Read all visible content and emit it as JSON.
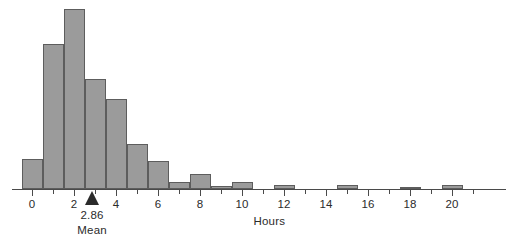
{
  "chart_data": {
    "type": "bar",
    "title": "",
    "xlabel": "Hours",
    "ylabel": "",
    "grid": false,
    "legend": null,
    "bin_width": 1,
    "x_axis": {
      "min": -0.5,
      "max": 22.3,
      "major_tick_labels": [
        "0",
        "2",
        "4",
        "6",
        "8",
        "10",
        "12",
        "14",
        "16",
        "18",
        "20"
      ],
      "major_tick_values": [
        0,
        2,
        4,
        6,
        8,
        10,
        12,
        14,
        16,
        18,
        20
      ],
      "minor_tick_values": [
        1,
        3,
        5,
        7,
        9,
        11,
        13,
        15,
        17,
        19,
        21
      ]
    },
    "bins": [
      {
        "left": -0.5,
        "right": 0.5,
        "center": 0,
        "height": 30
      },
      {
        "left": 0.5,
        "right": 1.5,
        "center": 1,
        "height": 145
      },
      {
        "left": 1.5,
        "right": 2.5,
        "center": 2,
        "height": 180
      },
      {
        "left": 2.5,
        "right": 3.5,
        "center": 3,
        "height": 110
      },
      {
        "left": 3.5,
        "right": 4.5,
        "center": 4,
        "height": 90
      },
      {
        "left": 4.5,
        "right": 5.5,
        "center": 5,
        "height": 45
      },
      {
        "left": 5.5,
        "right": 6.5,
        "center": 6,
        "height": 28
      },
      {
        "left": 6.5,
        "right": 7.5,
        "center": 7,
        "height": 7
      },
      {
        "left": 7.5,
        "right": 8.5,
        "center": 8,
        "height": 15
      },
      {
        "left": 8.5,
        "right": 9.5,
        "center": 9,
        "height": 3
      },
      {
        "left": 9.5,
        "right": 10.5,
        "center": 10,
        "height": 7
      },
      {
        "left": 11.5,
        "right": 12.5,
        "center": 12,
        "height": 4
      },
      {
        "left": 14.5,
        "right": 15.5,
        "center": 15,
        "height": 4
      },
      {
        "left": 17.5,
        "right": 18.5,
        "center": 18,
        "height": 2
      },
      {
        "left": 19.5,
        "right": 20.5,
        "center": 20,
        "height": 4
      }
    ],
    "annotations": [
      {
        "type": "mean-marker",
        "value": 2.86,
        "value_label": "2.86",
        "name_label": "Mean"
      }
    ],
    "colors": {
      "bar_fill": "#9b9b9b",
      "bar_stroke": "#5d5d5d",
      "axis": "#4a4a4a",
      "text": "#2b2b2b",
      "background": "#ffffff"
    }
  }
}
